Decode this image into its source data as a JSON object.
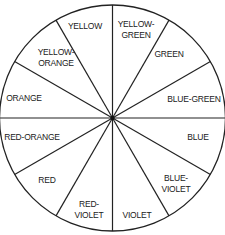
{
  "diagram": {
    "center": {
      "x": 112.5,
      "y": 118
    },
    "radius": 113,
    "stroke_color": "#222222",
    "fill_color": "#ffffff",
    "segments": [
      {
        "name": "yellow-green",
        "lines": [
          "YELLOW-",
          "GREEN"
        ],
        "x": 136,
        "y": 27
      },
      {
        "name": "green",
        "lines": [
          "GREEN"
        ],
        "x": 169,
        "y": 57
      },
      {
        "name": "blue-green",
        "lines": [
          "BLUE-GREEN"
        ],
        "x": 194,
        "y": 102
      },
      {
        "name": "blue",
        "lines": [
          "BLUE"
        ],
        "x": 198,
        "y": 140
      },
      {
        "name": "blue-violet",
        "lines": [
          "BLUE-",
          "VIOLET"
        ],
        "x": 176,
        "y": 181
      },
      {
        "name": "violet",
        "lines": [
          "VIOLET"
        ],
        "x": 137,
        "y": 218
      },
      {
        "name": "red-violet",
        "lines": [
          "RED-",
          "VIOLET"
        ],
        "x": 89,
        "y": 207
      },
      {
        "name": "red",
        "lines": [
          "RED"
        ],
        "x": 47,
        "y": 183
      },
      {
        "name": "red-orange",
        "lines": [
          "RED-ORANGE"
        ],
        "x": 32,
        "y": 140
      },
      {
        "name": "orange",
        "lines": [
          "ORANGE"
        ],
        "x": 24,
        "y": 101
      },
      {
        "name": "yellow-orange",
        "lines": [
          "YELLOW-",
          "ORANGE"
        ],
        "x": 56,
        "y": 55
      },
      {
        "name": "yellow",
        "lines": [
          "YELLOW"
        ],
        "x": 85,
        "y": 29
      }
    ]
  }
}
